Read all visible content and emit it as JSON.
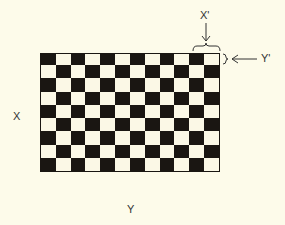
{
  "diagram": {
    "type": "checkerboard",
    "rows": 9,
    "cols": 12,
    "top_left_color": "black",
    "colors": {
      "dark": "#1a1612",
      "light": "#fbf8e6",
      "background": "#fdfbea"
    }
  },
  "labels": {
    "x_axis": "X",
    "y_axis": "Y",
    "x_prime": "X'",
    "y_prime": "Y'"
  }
}
